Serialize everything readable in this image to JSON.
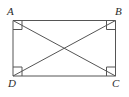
{
  "figure": {
    "kind": "geometry-diagram",
    "shape": "rectangle",
    "background_color": "#ffffff",
    "line_color": "#555555",
    "label_color": "#2b2b2b",
    "stroke_width": 1,
    "width": 129,
    "height": 97
  },
  "labels": {
    "top_left": "A",
    "top_right": "B",
    "bottom_right": "C",
    "bottom_left": "D"
  },
  "geometry": {
    "rect": {
      "left": 13,
      "top": 20.5,
      "right": 115.5,
      "bottom": 76
    },
    "vertices": {
      "A": {
        "x": 13,
        "y": 20.5
      },
      "B": {
        "x": 115.5,
        "y": 20.5
      },
      "C": {
        "x": 115.5,
        "y": 76
      },
      "D": {
        "x": 13,
        "y": 76
      }
    },
    "diagonals": [
      {
        "name": "AC",
        "from": "A",
        "to": "C"
      },
      {
        "name": "BD",
        "from": "B",
        "to": "D"
      }
    ],
    "intersection": {
      "x": 64.25,
      "y": 48.25
    },
    "right_angle_mark_size": 9
  }
}
